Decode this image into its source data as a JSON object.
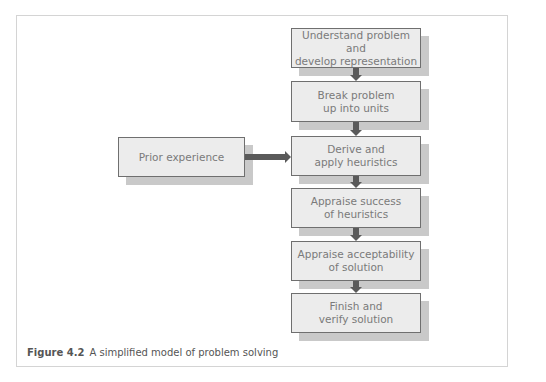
{
  "figure": {
    "number": "Figure 4.2",
    "caption": "A simplified model of problem solving"
  },
  "flow": {
    "steps": [
      {
        "label": "Understand problem and\ndevelop representation"
      },
      {
        "label": "Break problem\nup into units"
      },
      {
        "label": "Derive and\napply heuristics"
      },
      {
        "label": "Appraise success\nof heuristics"
      },
      {
        "label": "Appraise acceptability\nof solution"
      },
      {
        "label": "Finish and\nverify solution"
      }
    ],
    "side_input": {
      "label": "Prior experience",
      "target_step": 3
    }
  },
  "colors": {
    "box_fill": "#ececec",
    "box_border": "#6f6f6f",
    "shadow": "#c9c9c9",
    "arrow": "#5a5a5a",
    "text": "#7a7a7a"
  }
}
